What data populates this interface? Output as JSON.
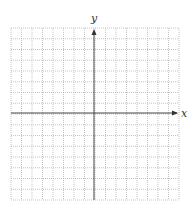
{
  "diagram": {
    "type": "coordinate-grid",
    "x_axis_label": "x",
    "y_axis_label": "y",
    "grid": {
      "columns": 16,
      "rows": 16,
      "left": 11,
      "top": 28,
      "right": 179,
      "bottom": 200,
      "line_style": "dotted",
      "line_color": "#b5b5b5"
    },
    "origin": {
      "px": 94,
      "py": 113
    },
    "axis_color": "#444444"
  }
}
